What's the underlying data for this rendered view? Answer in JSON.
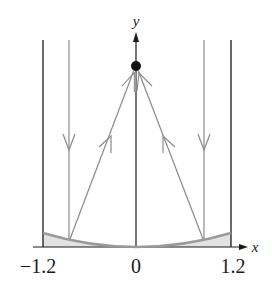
{
  "diagram": {
    "axes": {
      "x_label": "x",
      "y_label": "y",
      "x_ticks": [
        {
          "label": "−1.2",
          "value": -1.2
        },
        {
          "label": "0",
          "value": 0
        },
        {
          "label": "1.2",
          "value": 1.2
        }
      ]
    },
    "elements": {
      "walls": [
        "left-wall at x=-1.2",
        "right-wall at x=1.2"
      ],
      "incoming_rays": [
        "left vertical ray (downward)",
        "right vertical ray (downward)"
      ],
      "reflected_rays": [
        "left reflected ray toward focus (upward)",
        "right reflected ray toward focus (upward)"
      ],
      "focus": "black dot on y-axis",
      "mirror": "parabolic curve with shaded region beneath"
    },
    "colors": {
      "axis": "#1a1a1a",
      "ray": "#8a8a8a",
      "mirror": "#9a9a9a",
      "shade": "#e2e2e2",
      "focus": "#111111"
    }
  }
}
